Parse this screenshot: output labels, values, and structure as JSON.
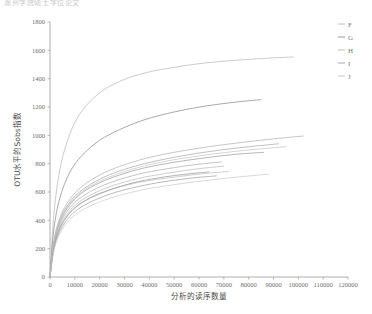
{
  "page": {
    "clipped_header_text": "滁州学院硕士学位论文"
  },
  "chart_data": {
    "type": "line",
    "title": "",
    "xlabel": "分析的读序数量",
    "ylabel": "OTU水平的Sobs指数",
    "xlim": [
      0,
      120000
    ],
    "ylim": [
      0,
      1800
    ],
    "grid": false,
    "legend_position": "right",
    "xticks": [
      0,
      10000,
      20000,
      30000,
      40000,
      50000,
      60000,
      70000,
      80000,
      90000,
      100000,
      110000,
      120000
    ],
    "yticks": [
      0,
      200,
      400,
      600,
      800,
      1000,
      1200,
      1400,
      1600,
      1800
    ],
    "legend": [
      "F",
      "G",
      "H",
      "I",
      "J"
    ],
    "series": [
      {
        "name": "F",
        "color": "#b9b9b9",
        "x": [
          0,
          1500,
          4000,
          8000,
          13000,
          20000,
          28000,
          38000,
          50000,
          62000,
          75000,
          88000,
          98000
        ],
        "values": [
          0,
          430,
          760,
          1010,
          1175,
          1300,
          1380,
          1440,
          1480,
          1510,
          1530,
          1545,
          1553
        ]
      },
      {
        "name": "G",
        "color": "#8d8d8d",
        "x": [
          0,
          1500,
          4000,
          8000,
          13000,
          20000,
          28000,
          38000,
          50000,
          62000,
          75000,
          85000
        ],
        "values": [
          0,
          330,
          560,
          740,
          860,
          965,
          1040,
          1110,
          1165,
          1205,
          1235,
          1252
        ]
      },
      {
        "name": "H",
        "color": "#b4b4b4",
        "x": [
          0,
          1500,
          4000,
          8000,
          13000,
          20000,
          28000,
          38000,
          50000,
          62000,
          75000,
          90000,
          102000
        ],
        "values": [
          0,
          250,
          420,
          550,
          640,
          720,
          780,
          835,
          880,
          915,
          945,
          975,
          995
        ]
      },
      {
        "name": "I",
        "color": "#9e9e9e",
        "x": [
          0,
          1500,
          4000,
          8000,
          13000,
          20000,
          28000,
          38000,
          50000,
          62000,
          74000,
          86000
        ],
        "values": [
          0,
          230,
          390,
          510,
          595,
          665,
          720,
          770,
          810,
          840,
          865,
          880
        ]
      },
      {
        "name": "J",
        "color": "#c2c2c2",
        "x": [
          0,
          1500,
          4000,
          8000,
          13000,
          20000,
          28000,
          38000,
          50000,
          62000,
          72000
        ],
        "values": [
          0,
          200,
          340,
          450,
          525,
          585,
          635,
          675,
          705,
          730,
          745
        ]
      },
      {
        "name": "extra-1",
        "color": "#ababab",
        "x": [
          0,
          1500,
          4000,
          8000,
          13000,
          20000,
          28000,
          38000,
          50000,
          62000,
          76000,
          92000
        ],
        "values": [
          0,
          240,
          405,
          530,
          615,
          690,
          748,
          800,
          845,
          880,
          912,
          940
        ]
      },
      {
        "name": "extra-2",
        "color": "#bdbdbd",
        "x": [
          0,
          1500,
          4000,
          8000,
          13000,
          20000,
          28000,
          38000,
          50000,
          60000,
          70000
        ],
        "values": [
          0,
          215,
          360,
          470,
          545,
          610,
          660,
          705,
          740,
          765,
          782
        ]
      },
      {
        "name": "extra-3",
        "color": "#a3a3a3",
        "x": [
          0,
          1500,
          4000,
          8000,
          13000,
          20000,
          28000,
          38000,
          48000,
          58000,
          67000
        ],
        "values": [
          0,
          190,
          325,
          428,
          498,
          558,
          606,
          648,
          678,
          700,
          714
        ]
      },
      {
        "name": "extra-4",
        "color": "#c7c7c7",
        "x": [
          0,
          1500,
          4000,
          8000,
          13000,
          20000,
          28000,
          38000,
          50000,
          63000,
          78000,
          95000
        ],
        "values": [
          0,
          235,
          398,
          520,
          604,
          676,
          732,
          784,
          828,
          862,
          893,
          920
        ]
      },
      {
        "name": "extra-5",
        "color": "#9a9a9a",
        "x": [
          0,
          1500,
          4000,
          8000,
          13000,
          20000,
          28000,
          36000,
          46000,
          56000,
          64000
        ],
        "values": [
          0,
          205,
          348,
          455,
          528,
          590,
          638,
          675,
          706,
          728,
          742
        ]
      },
      {
        "name": "extra-6",
        "color": "#cccccc",
        "x": [
          0,
          1500,
          4000,
          8000,
          13000,
          20000,
          28000,
          38000,
          50000,
          62000,
          74000,
          88000
        ],
        "values": [
          0,
          180,
          308,
          405,
          472,
          530,
          576,
          618,
          652,
          680,
          703,
          726
        ]
      },
      {
        "name": "extra-7",
        "color": "#b0b0b0",
        "x": [
          0,
          1500,
          4000,
          8000,
          13000,
          20000,
          28000,
          38000,
          50000,
          60000,
          69000
        ],
        "values": [
          0,
          222,
          375,
          490,
          568,
          636,
          688,
          735,
          772,
          796,
          812
        ]
      }
    ]
  }
}
